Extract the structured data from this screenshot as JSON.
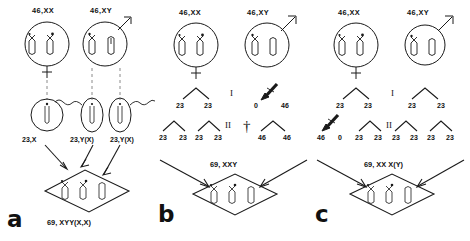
{
  "figure": {
    "ink_color": "#1a1a1a",
    "background": "#ffffff"
  },
  "panels": [
    {
      "letter": "a",
      "name": "dispermy",
      "parent_cells": [
        {
          "label": "46,XX",
          "sex": "female",
          "symbol": "venus"
        },
        {
          "label": "46,XY",
          "sex": "male",
          "symbol": "mars"
        }
      ],
      "gametes": [
        {
          "label": "23,X",
          "type": "ovum"
        },
        {
          "label": "23,Y(X)",
          "type": "sperm"
        },
        {
          "label": "23,Y(X)",
          "type": "sperm"
        }
      ],
      "zygote_label": "69, XYY(X,X)",
      "zygote_chromosome_groups": 3
    },
    {
      "letter": "b",
      "name": "diandry",
      "parent_cells": [
        {
          "label": "46,XX",
          "sex": "female",
          "symbol": "venus"
        },
        {
          "label": "46,XY",
          "sex": "male",
          "symbol": "mars"
        }
      ],
      "meiosis_i": {
        "roman": "I",
        "maternal_products": [
          "23",
          "23"
        ],
        "paternal_products": [
          "0",
          "46"
        ],
        "nondisjunction_on": "paternal"
      },
      "meiosis_ii": {
        "roman": "II",
        "maternal_products": [
          "23",
          "23",
          "23",
          "23"
        ],
        "paternal_products": [
          "46",
          "46"
        ],
        "death_symbol": "†"
      },
      "zygote_label": "69, XXY",
      "zygote_chromosome_groups": 3
    },
    {
      "letter": "c",
      "name": "digyny",
      "parent_cells": [
        {
          "label": "46,XX",
          "sex": "female",
          "symbol": "venus"
        },
        {
          "label": "46,XY",
          "sex": "male",
          "symbol": "mars"
        }
      ],
      "meiosis_i": {
        "roman": "I",
        "maternal_products": [
          "23",
          "23"
        ],
        "paternal_products": [
          "23",
          "23"
        ],
        "nondisjunction_on": "maternal"
      },
      "meiosis_ii": {
        "roman": "II",
        "maternal_products": [
          "46",
          "0",
          "23",
          "23"
        ],
        "paternal_products": [
          "23",
          "23",
          "23",
          "23"
        ]
      },
      "zygote_label": "69, XX X(Y)",
      "zygote_chromosome_groups": 3
    }
  ]
}
